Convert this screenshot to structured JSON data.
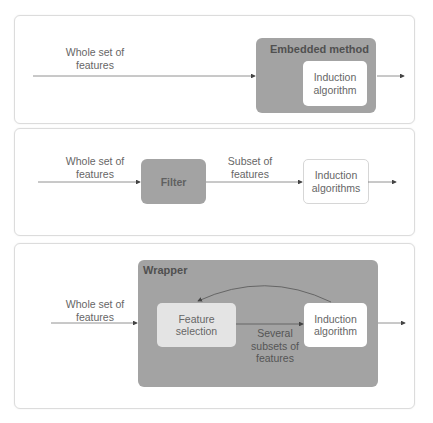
{
  "colors": {
    "dark_box": "#a3a3a3",
    "light_box": "#e4e4e4",
    "white_box": "#ffffff",
    "line": "#666666",
    "panel_border": "#dcdcdc"
  },
  "panels": {
    "embedded": {
      "input_label_1": "Whole set of",
      "input_label_2": "features",
      "method_title": "Embedded method",
      "inner_1": "Induction",
      "inner_2": "algorithm"
    },
    "filter": {
      "input_label_1": "Whole set of",
      "input_label_2": "features",
      "filter_label": "Filter",
      "subset_label_1": "Subset of",
      "subset_label_2": "features",
      "inner_1": "Induction",
      "inner_2": "algorithms"
    },
    "wrapper": {
      "input_label_1": "Whole set of",
      "input_label_2": "features",
      "method_title": "Wrapper",
      "selection_1": "Feature",
      "selection_2": "selection",
      "subsets_1": "Several",
      "subsets_2": "subsets of",
      "subsets_3": "features",
      "inner_1": "Induction",
      "inner_2": "algorithm"
    }
  }
}
